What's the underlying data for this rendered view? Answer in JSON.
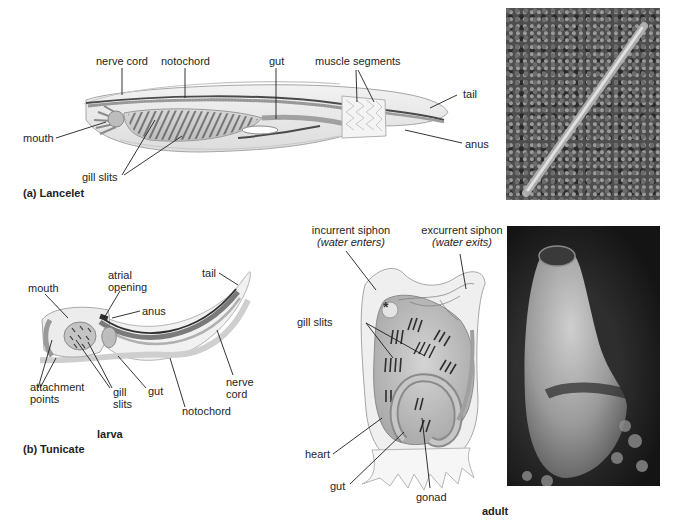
{
  "figure": {
    "panel_a": {
      "title": "(a) Lancelet",
      "labels": {
        "nerve_cord": "nerve cord",
        "notochord": "notochord",
        "gut": "gut",
        "muscle_segments": "muscle segments",
        "tail": "tail",
        "mouth": "mouth",
        "anus": "anus",
        "gill_slits": "gill slits"
      },
      "photo": "lancelet-photo"
    },
    "panel_b": {
      "title": "(b) Tunicate",
      "larva": {
        "caption": "larva",
        "labels": {
          "mouth": "mouth",
          "atrial_opening_1": "atrial",
          "atrial_opening_2": "opening",
          "anus": "anus",
          "tail": "tail",
          "attachment_points_1": "attachment",
          "attachment_points_2": "points",
          "gill_slits_1": "gill",
          "gill_slits_2": "slits",
          "gut": "gut",
          "nerve_cord_1": "nerve",
          "nerve_cord_2": "cord",
          "notochord": "notochord"
        }
      },
      "adult": {
        "caption": "adult",
        "labels": {
          "incurrent_siphon": "incurrent siphon",
          "incurrent_note": "(water enters)",
          "excurrent_siphon": "excurrent siphon",
          "excurrent_note": "(water exits)",
          "gill_slits": "gill slits",
          "heart": "heart",
          "gut": "gut",
          "gonad": "gonad"
        },
        "asterisk": "*"
      },
      "photo": "tunicate-photo"
    },
    "colors": {
      "ink": "#1e1e1e",
      "body_fill": "#e6e6e6",
      "body_stroke": "#9a9a9a",
      "dark_tissue": "#555555",
      "photo_dark": "#1c1c1c"
    }
  }
}
